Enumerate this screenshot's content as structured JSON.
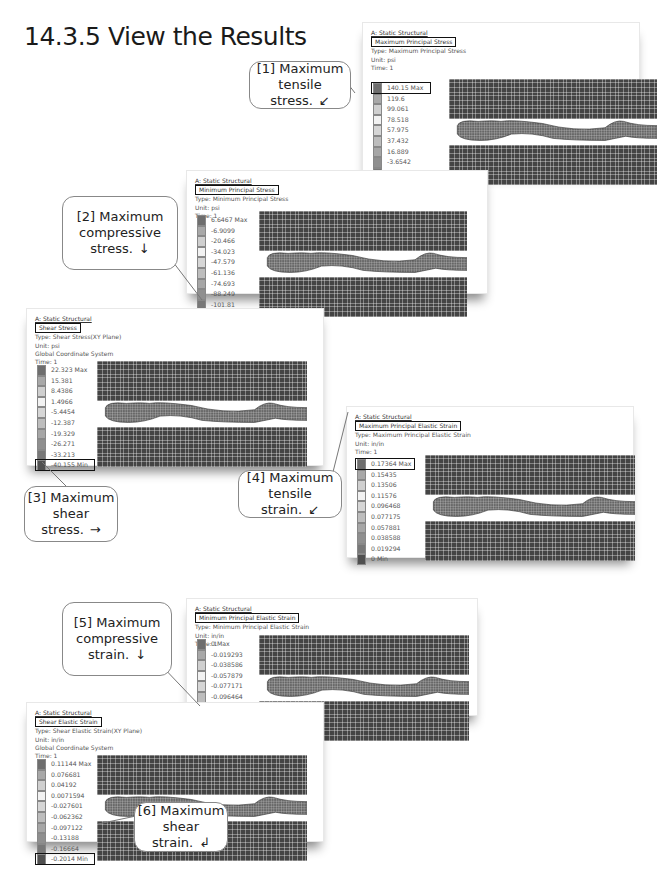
{
  "section_title": "14.3.5 View the Results",
  "panels": [
    {
      "id": "max-principal-stress",
      "analysis": "A: Static Structural",
      "result_title": "Maximum Principal Stress",
      "type": "Type: Maximum Principal Stress",
      "unit": "Unit: psi",
      "coord": "",
      "time": "Time: 1",
      "legend": [
        "140.15 Max",
        "119.6",
        "99.061",
        "78.518",
        "57.975",
        "37.432",
        "16.889",
        "-3.6542",
        "-24.197",
        "-44.74 Min"
      ]
    },
    {
      "id": "min-principal-stress",
      "analysis": "A: Static Structural",
      "result_title": "Minimum Principal Stress",
      "type": "Type: Minimum Principal Stress",
      "unit": "Unit: psi",
      "coord": "",
      "time": "Time: 1",
      "legend": [
        "6.6467 Max",
        "-6.9099",
        "-20.466",
        "-34.023",
        "-47.579",
        "-61.136",
        "-74.693",
        "-88.249",
        "-101.81",
        "-115.36 Min"
      ]
    },
    {
      "id": "shear-stress",
      "analysis": "A: Static Structural",
      "result_title": "Shear Stress",
      "type": "Type: Shear Stress(XY Plane)",
      "unit": "Unit: psi",
      "coord": "Global Coordinate System",
      "time": "Time: 1",
      "legend": [
        "22.323 Max",
        "15.381",
        "8.4386",
        "1.4966",
        "-5.4454",
        "-12.387",
        "-19.329",
        "-26.271",
        "-33.213",
        "-40.155 Min"
      ]
    },
    {
      "id": "max-principal-elastic-strain",
      "analysis": "A: Static Structural",
      "result_title": "Maximum Principal Elastic Strain",
      "type": "Type: Maximum Principal Elastic Strain",
      "unit": "Unit: in/in",
      "coord": "",
      "time": "Time: 1",
      "legend": [
        "0.17364 Max",
        "0.15435",
        "0.13506",
        "0.11576",
        "0.096468",
        "0.077175",
        "0.057881",
        "0.038588",
        "0.019294",
        "0 Min"
      ]
    },
    {
      "id": "min-principal-elastic-strain",
      "analysis": "A: Static Structural",
      "result_title": "Minimum Principal Elastic Strain",
      "type": "Type: Minimum Principal Elastic Strain",
      "unit": "Unit: in/in",
      "coord": "",
      "time": "Time: 1",
      "legend": [
        "0 Max",
        "-0.019293",
        "-0.038586",
        "-0.057879",
        "-0.077171",
        "-0.096464",
        "-0.11576",
        "-0.13505",
        "-0.15434",
        "-0.17364 Min"
      ]
    },
    {
      "id": "shear-elastic-strain",
      "analysis": "A: Static Structural",
      "result_title": "Shear Elastic Strain",
      "type": "Type: Shear Elastic Strain(XY Plane)",
      "unit": "Unit: in/in",
      "coord": "Global Coordinate System",
      "time": "Time: 1",
      "legend": [
        "0.11144 Max",
        "0.076681",
        "0.04192",
        "0.0071594",
        "-0.027601",
        "-0.062362",
        "-0.097122",
        "-0.13188",
        "-0.16664",
        "-0.2014 Min"
      ]
    }
  ],
  "legend_colors": [
    "#6e6e6e",
    "#a8a8a8",
    "#cfcfcf",
    "#f2f2f2",
    "#d6d6d6",
    "#bdbdbd",
    "#a6a6a6",
    "#8f8f8f",
    "#787878",
    "#505050"
  ],
  "callouts": [
    {
      "line1": "[1] Maximum",
      "line2": "tensile stress.",
      "arrow": "↙",
      "line3": ""
    },
    {
      "line1": "[2] Maximum",
      "line2": "compressive",
      "line3": "stress.",
      "arrow": "↓"
    },
    {
      "line1": "[3] Maximum",
      "line2": "shear stress.",
      "arrow": "→",
      "line3": ""
    },
    {
      "line1": "[4] Maximum",
      "line2": "tensile strain.",
      "arrow": "↙",
      "line3": ""
    },
    {
      "line1": "[5] Maximum",
      "line2": "compressive",
      "line3": "strain.",
      "arrow": "↓"
    },
    {
      "line1": "[6] Maximum",
      "line2": "shear strain.",
      "arrow": "↲",
      "line3": ""
    }
  ]
}
